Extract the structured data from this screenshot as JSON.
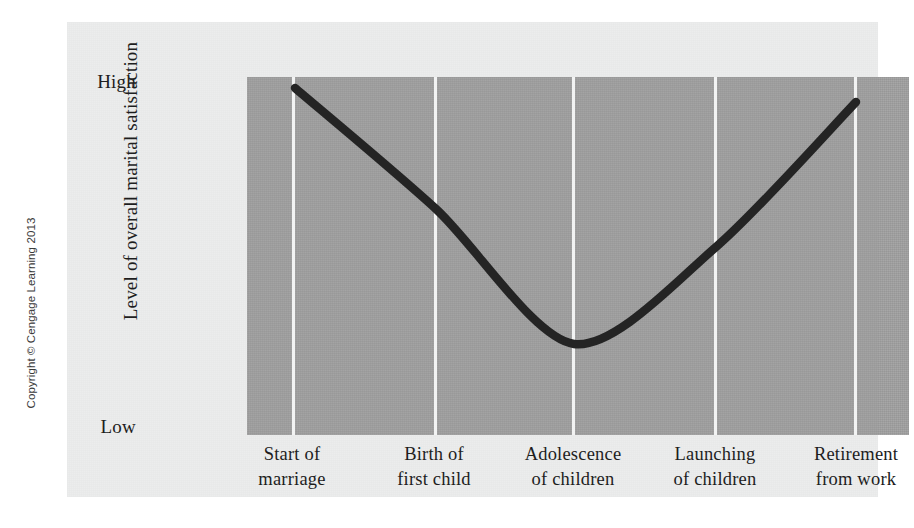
{
  "figure": {
    "copyright": "Copyright © Cengage Learning 2013",
    "background_color": "#ffffff",
    "panel_color": "#eceded",
    "plot_color": "#a1a1a1",
    "gridline_color": "#f2f3f3",
    "curve_color": "#242424"
  },
  "chart_data": {
    "type": "line",
    "title": "",
    "xlabel": "",
    "ylabel": "Level of overall marital satisfaction",
    "categories": [
      "Start of marriage",
      "Birth of first child",
      "Adolescence of children",
      "Launching of children",
      "Retirement from work"
    ],
    "category_lines": [
      [
        "Start of",
        "marriage"
      ],
      [
        "Birth of",
        "first child"
      ],
      [
        "Adolescence",
        "of children"
      ],
      [
        "Launching",
        "of children"
      ],
      [
        "Retirement",
        "from work"
      ]
    ],
    "ytick_labels": [
      "High",
      "Low"
    ],
    "ylim": [
      "Low",
      "High"
    ],
    "values": [
      0.97,
      0.63,
      0.25,
      0.53,
      0.93
    ],
    "series": [
      {
        "name": "Overall marital satisfaction",
        "values": [
          0.97,
          0.63,
          0.25,
          0.53,
          0.93
        ]
      }
    ],
    "curve_points": [
      {
        "x": 228,
        "y": 66
      },
      {
        "x": 369,
        "y": 187
      },
      {
        "x": 507,
        "y": 322
      },
      {
        "x": 649,
        "y": 225
      },
      {
        "x": 789,
        "y": 80
      }
    ],
    "grid": true,
    "grid_orientation": "vertical",
    "legend": "none",
    "annotation": "U-shaped (curvilinear) pattern of marital satisfaction across the family life cycle"
  }
}
